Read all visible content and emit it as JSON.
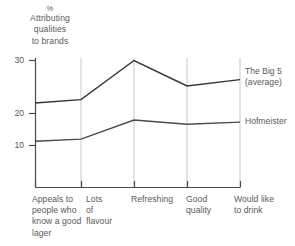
{
  "chart_data": {
    "type": "line",
    "title": "% Attributing qualities to brands",
    "title_lines": [
      "%",
      "Attributing",
      "qualities",
      "to brands"
    ],
    "xlabel": "",
    "ylabel": "% Attributing qualities to brands",
    "categories": [
      "Appeals to people who know a good lager",
      "Lots of flavour",
      "Refreshing",
      "Good quality",
      "Would like to drink"
    ],
    "category_lines": [
      [
        "Appeals to",
        "people who",
        "know a good",
        "lager"
      ],
      [
        "Lots",
        "of",
        "flavour"
      ],
      [
        "Refreshing"
      ],
      [
        "Good",
        "quality"
      ],
      [
        "Would like",
        "to drink"
      ]
    ],
    "series": [
      {
        "name": "The Big 5 (average)",
        "name_lines": [
          "The Big 5",
          "(average)"
        ],
        "values": [
          20,
          20.8,
          30,
          24,
          25.5
        ],
        "color": "#333333"
      },
      {
        "name": "Hofmeister",
        "name_lines": [
          "Hofmeister"
        ],
        "values": [
          11,
          11.5,
          16,
          15,
          15.5
        ],
        "color": "#4a4a4a"
      }
    ],
    "ylim": [
      0,
      32
    ],
    "yticks": [
      10,
      20,
      30
    ],
    "ytick_labels": [
      "10",
      "20",
      "30"
    ],
    "grid": true,
    "grid_orientation": "vertical",
    "grid_color": "#c8c8c8",
    "legend_position": "right-inline",
    "background_color": "#ffffff",
    "axis_color": "#4a4a4a"
  }
}
